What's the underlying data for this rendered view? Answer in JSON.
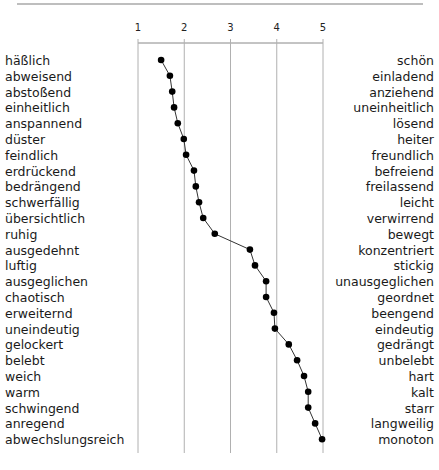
{
  "chart_data": {
    "type": "line",
    "title": "",
    "xlabel": "",
    "ylabel": "",
    "xlim": [
      1,
      5
    ],
    "x_ticks": [
      "1",
      "2",
      "3",
      "4",
      "5"
    ],
    "grid": "vertical lines at each tick",
    "orientation": "horizontal semantic differential profile",
    "series": [
      {
        "name": "profile",
        "left_labels": [
          "häßlich",
          "abweisend",
          "abstoßend",
          "einheitlich",
          "anspannend",
          "düster",
          "feindlich",
          "erdrückend",
          "bedrängend",
          "schwerfällig",
          "übersichtlich",
          "ruhig",
          "ausgedehnt",
          "luftig",
          "ausgeglichen",
          "chaotisch",
          "erweiternd",
          "uneindeutig",
          "gelockert",
          "belebt",
          "weich",
          "warm",
          "schwingend",
          "anregend",
          "abwechslungsreich"
        ],
        "right_labels": [
          "schön",
          "einladend",
          "anziehend",
          "uneinheitlich",
          "lösend",
          "heiter",
          "freundlich",
          "befreiend",
          "freilassend",
          "leicht",
          "verwirrend",
          "bewegt",
          "konzentriert",
          "stickig",
          "unausgeglichen",
          "geordnet",
          "beengend",
          "eindeutig",
          "gedrängt",
          "unbelebt",
          "hart",
          "kalt",
          "starr",
          "langweilig",
          "monoton"
        ],
        "values": [
          1.5,
          1.69,
          1.74,
          1.78,
          1.86,
          1.99,
          2.04,
          2.21,
          2.25,
          2.32,
          2.41,
          2.66,
          3.42,
          3.53,
          3.77,
          3.77,
          3.94,
          3.96,
          4.26,
          4.44,
          4.59,
          4.68,
          4.68,
          4.83,
          4.98
        ]
      }
    ]
  },
  "colors": {
    "line": "#333333",
    "marker": "#000000",
    "grid": "#b0b0b0",
    "separator": "#a0a0a0"
  }
}
